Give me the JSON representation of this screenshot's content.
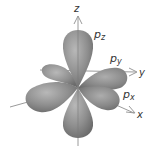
{
  "diagram": {
    "axes": [
      {
        "name": "z",
        "label": "z"
      },
      {
        "name": "y",
        "label": "y"
      },
      {
        "name": "x",
        "label": "x"
      }
    ],
    "orbitals": [
      {
        "name": "pz",
        "label_main": "p",
        "label_sub": "z"
      },
      {
        "name": "py",
        "label_main": "p",
        "label_sub": "y"
      },
      {
        "name": "px",
        "label_main": "p",
        "label_sub": "x"
      }
    ],
    "colors": {
      "lobe_fill": "#8c8c8c",
      "lobe_highlight": "#b5b5b5",
      "lobe_shadow": "#6e6e6e",
      "axis": "#9a9a9a",
      "label": "#333333"
    }
  }
}
